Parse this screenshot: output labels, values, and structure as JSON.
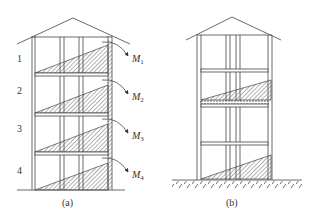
{
  "figure": {
    "panels": [
      {
        "id": "a",
        "caption": "(a)",
        "stories": [
          {
            "number": "1",
            "moment": "M",
            "moment_sub": "1"
          },
          {
            "number": "2",
            "moment": "M",
            "moment_sub": "2"
          },
          {
            "number": "3",
            "moment": "M",
            "moment_sub": "3"
          },
          {
            "number": "4",
            "moment": "M",
            "moment_sub": "4"
          }
        ]
      },
      {
        "id": "b",
        "caption": "(b)"
      }
    ],
    "colors": {
      "line": "#444444",
      "hatch": "#555555",
      "background": "#ffffff"
    }
  }
}
